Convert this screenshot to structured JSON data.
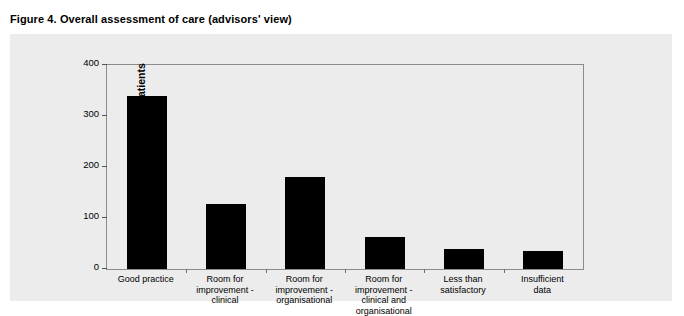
{
  "figure": {
    "title": "Figure 4. Overall assessment of care (advisors' view)"
  },
  "colors": {
    "panel_background": "#ececec",
    "page_background": "#ffffff",
    "bar_fill": "#000000",
    "frame_border": "#8c8c8c",
    "axis_text": "#000000"
  },
  "chart_data": {
    "type": "bar",
    "title": "Figure 4. Overall assessment of care (advisors' view)",
    "xlabel": "",
    "ylabel": "Number of patients",
    "ylim": [
      0,
      400
    ],
    "yticks": [
      0,
      100,
      200,
      300,
      400
    ],
    "grid": false,
    "legend": null,
    "categories": [
      "Good practice",
      "Room for\nimprovement -\nclinical",
      "Room for\nimprovement -\norganisational",
      "Room for\nimprovement -\nclinical and\norganisational",
      "Less than\nsatisfactory",
      "Insufficient\ndata"
    ],
    "values": [
      340,
      127,
      180,
      62,
      40,
      35
    ]
  }
}
